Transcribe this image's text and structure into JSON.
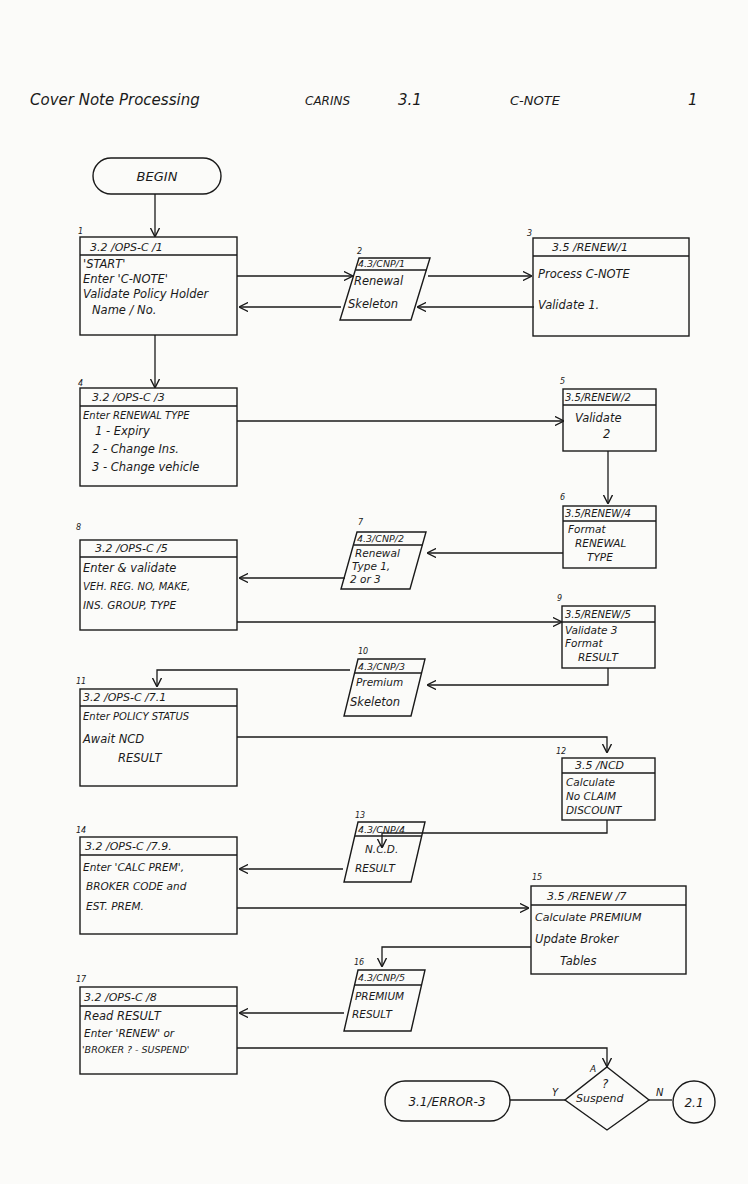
{
  "header": {
    "title": "Cover Note Processing",
    "system": "CARINS",
    "section": "3.1",
    "module": "C-NOTE",
    "page": "1"
  },
  "terminators": {
    "begin": "BEGIN",
    "error": "3.1/ERROR-3",
    "connector": "2.1"
  },
  "decision": {
    "mark": "A",
    "question": "?",
    "label": "Suspend",
    "yes": "Y",
    "no": "N"
  },
  "nodes": [
    {
      "num": "1",
      "id": "3.2 /OPS-C /1",
      "lines": [
        "'START'",
        "Enter 'C-NOTE'",
        "Validate Policy Holder",
        "Name / No."
      ]
    },
    {
      "num": "2",
      "id": "4.3/CNP/1",
      "lines": [
        "Renewal",
        "Skeleton"
      ]
    },
    {
      "num": "3",
      "id": "3.5 /RENEW/1",
      "lines": [
        "Process C-NOTE",
        "Validate 1."
      ]
    },
    {
      "num": "4",
      "id": "3.2 /OPS-C /3",
      "lines": [
        "Enter RENEWAL TYPE",
        "1 - Expiry",
        "2 - Change Ins.",
        "3 - Change vehicle"
      ]
    },
    {
      "num": "5",
      "id": "3.5/RENEW/2",
      "lines": [
        "Validate",
        "2"
      ]
    },
    {
      "num": "6",
      "id": "3.5/RENEW/4",
      "lines": [
        "Format",
        "RENEWAL",
        "TYPE"
      ]
    },
    {
      "num": "7",
      "id": "4.3/CNP/2",
      "lines": [
        "Renewal",
        "Type 1,",
        "2 or 3"
      ]
    },
    {
      "num": "8",
      "id": "3.2 /OPS-C /5",
      "lines": [
        "Enter & validate",
        "VEH. REG. NO, MAKE,",
        "INS. GROUP, TYPE"
      ]
    },
    {
      "num": "9",
      "id": "3.5/RENEW/5",
      "lines": [
        "Validate 3",
        "Format",
        "RESULT"
      ]
    },
    {
      "num": "10",
      "id": "4.3/CNP/3",
      "lines": [
        "Premium",
        "Skeleton"
      ]
    },
    {
      "num": "11",
      "id": "3.2 /OPS-C /7.1",
      "lines": [
        "Enter POLICY STATUS",
        "Await NCD",
        "RESULT"
      ]
    },
    {
      "num": "12",
      "id": "3.5 /NCD",
      "lines": [
        "Calculate",
        "No CLAIM",
        "DISCOUNT"
      ]
    },
    {
      "num": "13",
      "id": "4.3/CNP/4",
      "lines": [
        "N.C.D.",
        "RESULT"
      ]
    },
    {
      "num": "14",
      "id": "3.2 /OPS-C /7.9.",
      "lines": [
        "Enter 'CALC PREM',",
        "BROKER CODE and",
        "EST. PREM."
      ]
    },
    {
      "num": "15",
      "id": "3.5 /RENEW /7",
      "lines": [
        "Calculate PREMIUM",
        "Update Broker",
        "Tables"
      ]
    },
    {
      "num": "16",
      "id": "4.3/CNP/5",
      "lines": [
        "PREMIUM",
        "RESULT"
      ]
    },
    {
      "num": "17",
      "id": "3.2 /OPS-C /8",
      "lines": [
        "Read RESULT",
        "Enter 'RENEW' or",
        "'BROKER ? - SUSPEND'"
      ]
    }
  ]
}
